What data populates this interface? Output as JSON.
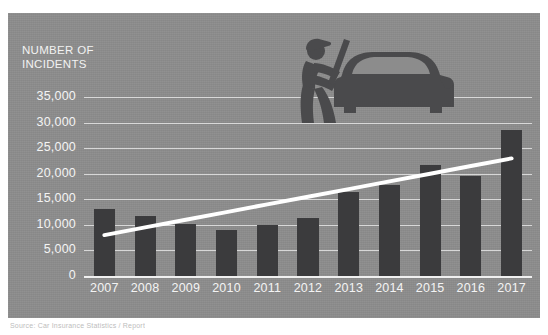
{
  "chart_data": {
    "type": "bar",
    "title": "",
    "ylabel": "NUMBER OF\nINCIDENTS",
    "xlabel": "",
    "categories": [
      "2007",
      "2008",
      "2009",
      "2010",
      "2011",
      "2012",
      "2013",
      "2014",
      "2015",
      "2016",
      "2017"
    ],
    "values": [
      13200,
      11800,
      10100,
      9000,
      9900,
      11300,
      16500,
      17800,
      21800,
      19600,
      28500
    ],
    "ylim": [
      0,
      35000
    ],
    "ytick_labels": [
      "35,000",
      "30,000",
      "25,000",
      "20,000",
      "15,000",
      "10,000",
      "5,000",
      "0"
    ],
    "ytick_values": [
      35000,
      30000,
      25000,
      20000,
      15000,
      10000,
      5000,
      0
    ],
    "grid": true,
    "legend": "none",
    "series": [
      {
        "name": "Number of incidents",
        "type": "bar",
        "color": "#3b3b3d",
        "values": [
          13200,
          11800,
          10100,
          9000,
          9900,
          11300,
          16500,
          17800,
          21800,
          19600,
          28500
        ]
      },
      {
        "name": "Trend line",
        "type": "line",
        "color": "#ffffff",
        "values": [
          8000,
          9500,
          11000,
          12500,
          14000,
          15500,
          17000,
          18500,
          20000,
          21500,
          23000
        ]
      }
    ]
  },
  "panel": {
    "background_color": "#8c8c8c",
    "bar_color": "#3b3b3d",
    "grid_color": "#f5f5f5",
    "text_color": "#f4f4f4",
    "trend_color": "#ffffff"
  },
  "illustration": {
    "name": "car-theft-silhouette",
    "description": "Silhouette of a person wearing a cap holding a crowbar breaking into a car",
    "color": "#4a4a4c"
  },
  "footer": {
    "source_text": "Source: Car Insurance Statistics / Report"
  }
}
